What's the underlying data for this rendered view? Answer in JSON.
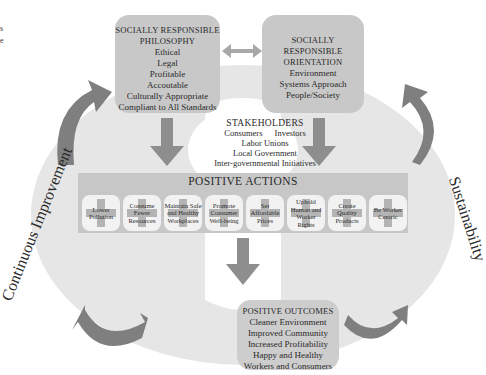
{
  "edge_fragments": [
    "s",
    "e"
  ],
  "philosophy": {
    "title_line1": "SOCIALLY RESPONSIBLE",
    "title_line2": "PHILOSOPHY",
    "items": [
      "Ethical",
      "Legal",
      "Profitable",
      "Accoutable",
      "Culturally Appropriate",
      "Compliant to All Standards"
    ]
  },
  "orientation": {
    "title_line1": "SOCIALLY RESPONSIBLE",
    "title_line2": "ORIENTATION",
    "items": [
      "Environment",
      "Systems Approach",
      "People/Society"
    ]
  },
  "stakeholders": {
    "title": "STAKEHOLDERS",
    "row1": [
      "Consumers",
      "Investors"
    ],
    "items": [
      "Labor Unions",
      "Local Government",
      "Inter-governmental Initiatives"
    ]
  },
  "positive_actions": {
    "title": "POSITIVE ACTIONS",
    "items": [
      "Lower Pollution",
      "Consume Fewer Resources",
      "Maintain Safe and Healthy Workplaces",
      "Promote Consumer Well-being",
      "Set Affordable Prices",
      "Uphold Human and Worker Rights",
      "Create Quality Products",
      "Be Worker Centric"
    ]
  },
  "positive_outcomes": {
    "title": "POSITIVE OUTCOMES",
    "items": [
      "Cleaner Environment",
      "Improved Community",
      "Increased Profitability",
      "Happy and Healthy",
      "Workers and Consumers"
    ]
  },
  "side_labels": {
    "left": "Continuous Improvement",
    "right": "Sustainability"
  },
  "colors": {
    "ellipse": "#e6e6e6",
    "box": "#c8c8c8",
    "arrow": "#8e8e8e",
    "curved_arrow": "#7f7f7f"
  }
}
